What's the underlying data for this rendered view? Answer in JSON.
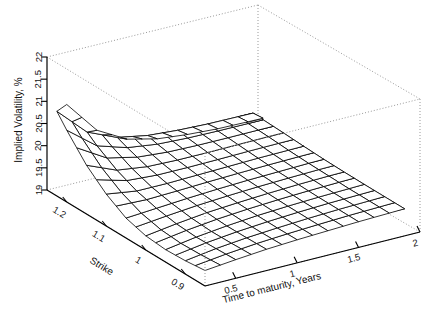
{
  "figure": {
    "kind": "3d-surface-wireframe",
    "background_color": "#ffffff",
    "mesh_color": "#000000",
    "box_color": "#999999"
  },
  "chart_data": {
    "type": "surface",
    "title": "",
    "subtitle": "",
    "xlabel": "Strike",
    "ylabel": "Time to maturity, Years",
    "zlabel": "Implied Volatility, %",
    "grid": false,
    "legend": "none",
    "projection": "persp",
    "x": [
      0.85,
      0.9,
      0.95,
      1.0,
      1.05,
      1.1,
      1.15,
      1.2,
      1.25
    ],
    "y": [
      0.25,
      0.5,
      0.75,
      1.0,
      1.25,
      1.5,
      1.75,
      2.0
    ],
    "x_ticks": [
      "1.2",
      "1.1",
      "1",
      "0.9"
    ],
    "x_tick_values": [
      1.2,
      1.1,
      1.0,
      0.9
    ],
    "y_ticks": [
      "0.5",
      "1",
      "1.5",
      "2"
    ],
    "y_tick_values": [
      0.5,
      1.0,
      1.5,
      2.0
    ],
    "z_ticks": [
      "19",
      "19.5",
      "20",
      "20.5",
      "21",
      "21.5",
      "22"
    ],
    "z_tick_values": [
      19,
      19.5,
      20,
      20.5,
      21,
      21.5,
      22
    ],
    "xlim": [
      0.85,
      1.25
    ],
    "ylim": [
      0.25,
      2.0
    ],
    "zlim": [
      19,
      22
    ],
    "z_label_x_axis": "Strike",
    "z_label_y_axis": "Time to maturity, Years",
    "z_rows_note": "rows indexed by x (Strike), columns indexed by y (Time to maturity)",
    "z": [
      [
        19.35,
        19.42,
        19.48,
        19.52,
        19.55,
        19.58,
        19.6,
        19.62
      ],
      [
        19.3,
        19.4,
        19.47,
        19.52,
        19.56,
        19.59,
        19.61,
        19.63
      ],
      [
        19.28,
        19.39,
        19.47,
        19.53,
        19.57,
        19.6,
        19.62,
        19.64
      ],
      [
        19.32,
        19.42,
        19.5,
        19.55,
        19.59,
        19.62,
        19.64,
        19.65
      ],
      [
        19.45,
        19.5,
        19.55,
        19.59,
        19.62,
        19.64,
        19.66,
        19.67
      ],
      [
        19.72,
        19.62,
        19.62,
        19.64,
        19.66,
        19.68,
        19.69,
        19.7
      ],
      [
        20.1,
        19.82,
        19.73,
        19.71,
        19.71,
        19.72,
        19.73,
        19.73
      ],
      [
        20.62,
        20.1,
        19.89,
        19.8,
        19.77,
        19.76,
        19.76,
        19.76
      ],
      [
        21.2,
        20.45,
        20.08,
        19.92,
        19.85,
        19.81,
        19.8,
        19.79
      ]
    ]
  },
  "axes": {
    "z_axis": {
      "label": "Implied Volatility, %",
      "ticks": [
        "19",
        "19.5",
        "20",
        "20.5",
        "21",
        "21.5",
        "22"
      ]
    },
    "x_axis": {
      "label": "Strike",
      "ticks": [
        "1.2",
        "1.1",
        "1",
        "0.9"
      ]
    },
    "y_axis": {
      "label": "Time to maturity, Years",
      "ticks": [
        "0.5",
        "1",
        "1.5",
        "2"
      ]
    }
  }
}
